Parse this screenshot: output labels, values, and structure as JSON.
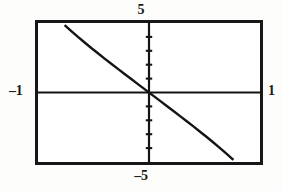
{
  "viewport": {
    "ymax_label": "5",
    "ymin_label": "–5",
    "xmin_label": "–1",
    "xmax_label": "1"
  },
  "chart_data": {
    "type": "line",
    "title": "",
    "subtitle": "",
    "xlabel": "",
    "ylabel": "",
    "grid": false,
    "legend": false,
    "legend_position": "none",
    "axis_style": "calculator-screen-crosshair",
    "xlim": [
      -1,
      1
    ],
    "ylim": [
      -5,
      5
    ],
    "xtick_labels": [
      "–1",
      "1"
    ],
    "ytick_labels": [
      "–5",
      "5"
    ],
    "x_axis_ticks": [],
    "y_axis_ticks": [
      -4,
      -3,
      -2,
      -1,
      1,
      2,
      3,
      4
    ],
    "annotations": [],
    "series": [
      {
        "name": "curve",
        "color": "#141414",
        "x": [
          -0.76,
          -0.7,
          -0.64,
          -0.58,
          -0.52,
          -0.46,
          -0.4,
          -0.34,
          -0.28,
          -0.22,
          -0.16,
          -0.1,
          -0.04,
          0.0,
          0.04,
          0.1,
          0.16,
          0.22,
          0.28,
          0.34,
          0.4,
          0.46,
          0.52,
          0.58,
          0.64,
          0.7,
          0.76
        ],
        "y": [
          4.85,
          4.42,
          4.0,
          3.6,
          3.2,
          2.82,
          2.44,
          2.07,
          1.7,
          1.33,
          0.97,
          0.6,
          0.24,
          0.0,
          -0.24,
          -0.6,
          -0.97,
          -1.33,
          -1.7,
          -2.07,
          -2.44,
          -2.82,
          -3.2,
          -3.6,
          -4.0,
          -4.42,
          -4.85
        ]
      }
    ]
  }
}
